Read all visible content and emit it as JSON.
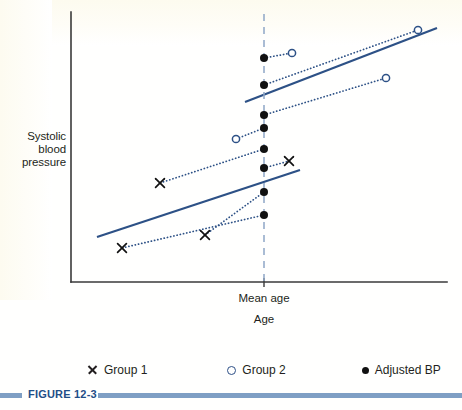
{
  "figure": {
    "caption": "FIGURE 12-3",
    "caption_color": "#1f4e87",
    "rule_color": "#7f9fc4"
  },
  "axes": {
    "y_label": "Systolic\nblood\npressure",
    "y_label_line1": "Systolic",
    "y_label_line2": "blood",
    "y_label_line3": "pressure",
    "x_title": "Age",
    "x_tick_label": "Mean age",
    "axis_color": "#3a3a3a"
  },
  "legend": {
    "position": "below-plot",
    "items": [
      {
        "marker": "cross-marker-icon",
        "label": "Group 1",
        "color": "#231f20"
      },
      {
        "marker": "open-circle-marker-icon",
        "label": "Group 2",
        "color": "#2d4f86"
      },
      {
        "marker": "filled-dot-marker-icon",
        "label": "Adjusted BP",
        "color": "#111111"
      }
    ]
  },
  "colors": {
    "line_blue": "#2d5186",
    "dotted_blue": "#2d5186",
    "mean_age_dash": "#8fa7c6",
    "marker_black": "#111111",
    "background": "#ffffff"
  },
  "chart_data": {
    "type": "scatter",
    "title": "",
    "xlabel": "Age",
    "ylabel": "Systolic blood pressure",
    "grid": false,
    "legend_position": "bottom",
    "axis_ranges": {
      "x_pixels": [
        71,
        447
      ],
      "y_pixels": [
        12,
        282
      ]
    },
    "mean_age_line_x": 264,
    "note": "Analysis of covariance illustration: each subject's observed value is projected back along the common within-group regression slope to the mean age, giving the adjusted BP on the dashed vertical line.",
    "common_slope": -0.385,
    "regression_lines": [
      {
        "name": "Group 2 regression line",
        "x1": 245,
        "y1": 102,
        "x2": 437,
        "y2": 28,
        "style": "solid"
      },
      {
        "name": "Group 1 regression line",
        "x1": 97,
        "y1": 237,
        "x2": 300,
        "y2": 170,
        "style": "solid"
      }
    ],
    "series": [
      {
        "name": "Group 1",
        "marker": "cross",
        "points": [
          {
            "x": 289,
            "y": 161
          },
          {
            "x": 160,
            "y": 183
          },
          {
            "x": 205,
            "y": 235
          },
          {
            "x": 122,
            "y": 248
          }
        ]
      },
      {
        "name": "Group 2",
        "marker": "open-circle",
        "points": [
          {
            "x": 418,
            "y": 30
          },
          {
            "x": 292,
            "y": 53
          },
          {
            "x": 386,
            "y": 78
          },
          {
            "x": 236,
            "y": 139
          }
        ]
      },
      {
        "name": "Adjusted BP",
        "marker": "filled-dot",
        "points": [
          {
            "x": 264,
            "y": 58,
            "from_series": "Group 2",
            "from_index": 1
          },
          {
            "x": 264,
            "y": 85,
            "from_series": "Group 2",
            "from_index": 0
          },
          {
            "x": 264,
            "y": 115,
            "from_series": "Group 2",
            "from_index": 2
          },
          {
            "x": 264,
            "y": 128,
            "from_series": "Group 2",
            "from_index": 3
          },
          {
            "x": 264,
            "y": 149,
            "from_series": "Group 1",
            "from_index": 1
          },
          {
            "x": 264,
            "y": 168,
            "from_series": "Group 1",
            "from_index": 0
          },
          {
            "x": 264,
            "y": 192,
            "from_series": "Group 1",
            "from_index": 2
          },
          {
            "x": 264,
            "y": 215,
            "from_series": "Group 1",
            "from_index": 3
          }
        ]
      }
    ],
    "projection_segments": [
      {
        "name": "proj-g2-b",
        "x1": 264,
        "y1": 58,
        "x2": 292,
        "y2": 53
      },
      {
        "name": "proj-g2-a",
        "x1": 264,
        "y1": 85,
        "x2": 418,
        "y2": 30
      },
      {
        "name": "proj-g2-c",
        "x1": 264,
        "y1": 115,
        "x2": 386,
        "y2": 78
      },
      {
        "name": "proj-g2-d",
        "x1": 264,
        "y1": 128,
        "x2": 236,
        "y2": 139
      },
      {
        "name": "proj-g1-b",
        "x1": 264,
        "y1": 149,
        "x2": 160,
        "y2": 183
      },
      {
        "name": "proj-g1-a",
        "x1": 264,
        "y1": 168,
        "x2": 289,
        "y2": 161
      },
      {
        "name": "proj-g1-c",
        "x1": 264,
        "y1": 192,
        "x2": 205,
        "y2": 235
      },
      {
        "name": "proj-g1-d",
        "x1": 264,
        "y1": 215,
        "x2": 122,
        "y2": 248
      }
    ]
  }
}
